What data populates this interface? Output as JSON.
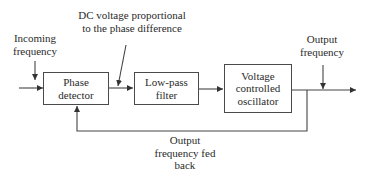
{
  "diagram": {
    "type": "block-diagram",
    "colors": {
      "line": "#444444",
      "text": "#2a2a2a",
      "background": "#ffffff"
    },
    "blocks": [
      {
        "id": "phase-detector",
        "lines": [
          "Phase",
          "detector"
        ]
      },
      {
        "id": "low-pass-filter",
        "lines": [
          "Low-pass",
          "filter"
        ]
      },
      {
        "id": "vco",
        "lines": [
          "Voltage",
          "controlled",
          "oscillator"
        ]
      }
    ],
    "labels": {
      "incoming_frequency": [
        "Incoming",
        "frequency"
      ],
      "dc_voltage": [
        "DC voltage proportional",
        "to the phase difference"
      ],
      "output_frequency": [
        "Output",
        "frequency"
      ],
      "feedback": [
        "Output",
        "frequency fed",
        "back"
      ]
    },
    "connections": [
      {
        "from": "input",
        "to": "phase-detector"
      },
      {
        "from": "phase-detector",
        "to": "low-pass-filter"
      },
      {
        "from": "low-pass-filter",
        "to": "vco"
      },
      {
        "from": "vco",
        "to": "output"
      },
      {
        "from": "vco-output",
        "to": "phase-detector",
        "label": "feedback"
      }
    ]
  }
}
